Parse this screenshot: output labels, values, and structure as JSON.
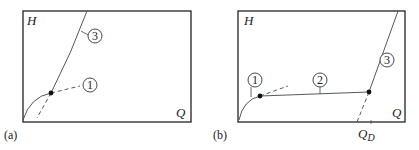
{
  "panels": [
    {
      "id": "a",
      "caption": "(a)",
      "y_axis_label": "H",
      "x_axis_label": "Q",
      "callouts": [
        {
          "label": "3",
          "meaning": "steep curve"
        },
        {
          "label": "1",
          "meaning": "curve through operating point"
        }
      ]
    },
    {
      "id": "b",
      "caption": "(b)",
      "y_axis_label": "H",
      "x_axis_label": "Q",
      "marker_label": "Q",
      "marker_subscript": "D",
      "callouts": [
        {
          "label": "1"
        },
        {
          "label": "2"
        },
        {
          "label": "3"
        }
      ]
    }
  ],
  "colors": {
    "line": "#333333",
    "frame": "#222222",
    "dot": "#111111"
  }
}
